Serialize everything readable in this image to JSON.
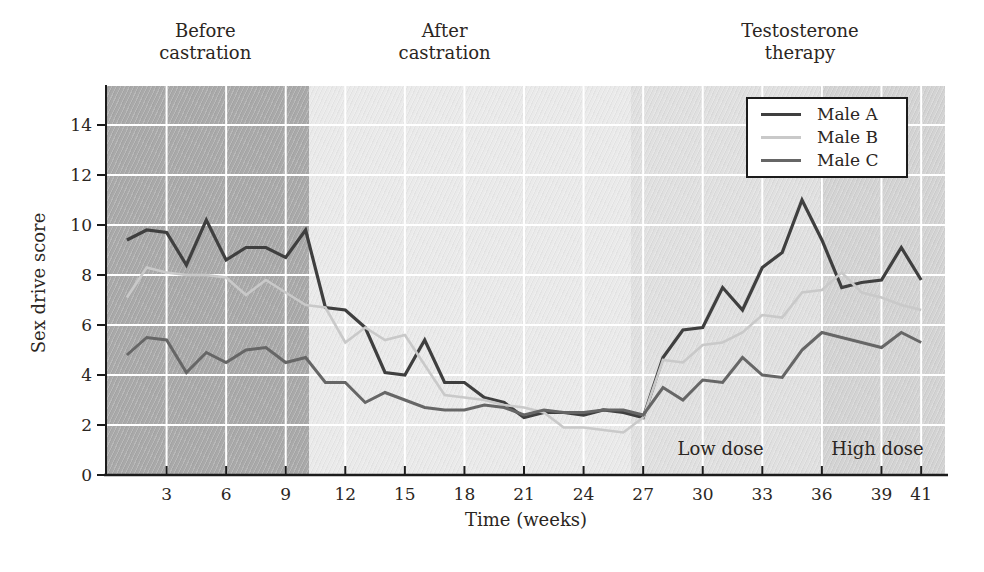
{
  "figure": {
    "x_axis_label": "Time (weeks)",
    "y_axis_label": "Sex drive score",
    "phase_labels": [
      {
        "text": "Before\ncastration",
        "center_week": 4.95
      },
      {
        "text": "After\ncastration",
        "center_week": 17.0
      },
      {
        "text": "Testosterone\ntherapy",
        "center_week": 34.9
      }
    ],
    "dose_labels": [
      {
        "text": "Low dose",
        "center_week": 30.9,
        "value": 1.1
      },
      {
        "text": "High dose",
        "center_week": 38.8,
        "value": 1.1
      }
    ]
  },
  "legend": {
    "items": [
      {
        "label": "Male A"
      },
      {
        "label": "Male B"
      },
      {
        "label": "Male C"
      }
    ]
  },
  "chart_data": {
    "type": "line",
    "title": "",
    "xlabel": "Time (weeks)",
    "ylabel": "Sex drive score",
    "xlim": [
      0,
      42.2
    ],
    "ylim": [
      0,
      15.56
    ],
    "x_ticks": [
      3,
      6,
      9,
      12,
      15,
      18,
      21,
      24,
      27,
      30,
      33,
      36,
      39,
      41
    ],
    "y_ticks": [
      0,
      2,
      4,
      6,
      8,
      10,
      12,
      14
    ],
    "grid": true,
    "grid_color": "#ffffff",
    "axis_color": "#1c1c1c",
    "legend_position": "top-right",
    "weeks": [
      1,
      2,
      3,
      4,
      5,
      6,
      7,
      8,
      9,
      10,
      11,
      12,
      13,
      14,
      15,
      16,
      17,
      18,
      19,
      20,
      21,
      22,
      23,
      24,
      25,
      26,
      27,
      28,
      29,
      30,
      31,
      32,
      33,
      34,
      35,
      36,
      37,
      38,
      39,
      40,
      41
    ],
    "series": [
      {
        "name": "Male A",
        "color": "#3f3f3f",
        "stroke_width": 3.2,
        "values": [
          9.4,
          9.8,
          9.7,
          8.4,
          10.2,
          8.6,
          9.1,
          9.1,
          8.7,
          9.8,
          6.7,
          6.6,
          5.9,
          4.1,
          4.0,
          5.4,
          3.7,
          3.7,
          3.1,
          2.9,
          2.3,
          2.5,
          2.5,
          2.4,
          2.6,
          2.5,
          2.3,
          4.7,
          5.8,
          5.9,
          7.5,
          6.6,
          8.3,
          8.9,
          11.0,
          9.4,
          7.5,
          7.7,
          7.8,
          9.1,
          7.8
        ]
      },
      {
        "name": "Male B",
        "color": "#c9c9c9",
        "stroke_width": 2.6,
        "values": [
          7.1,
          8.3,
          8.1,
          8.0,
          8.0,
          7.9,
          7.2,
          7.8,
          7.3,
          6.8,
          6.7,
          5.3,
          5.9,
          5.4,
          5.6,
          4.4,
          3.2,
          3.1,
          3.0,
          2.8,
          2.7,
          2.5,
          1.9,
          1.9,
          1.8,
          1.7,
          2.3,
          4.6,
          4.5,
          5.2,
          5.3,
          5.7,
          6.4,
          6.3,
          7.3,
          7.4,
          8.1,
          7.3,
          7.1,
          6.8,
          6.6
        ]
      },
      {
        "name": "Male C",
        "color": "#666666",
        "stroke_width": 3.0,
        "values": [
          4.8,
          5.5,
          5.4,
          4.1,
          4.9,
          4.5,
          5.0,
          5.1,
          4.5,
          4.7,
          3.7,
          3.7,
          2.9,
          3.3,
          3.0,
          2.7,
          2.6,
          2.6,
          2.8,
          2.7,
          2.4,
          2.6,
          2.5,
          2.5,
          2.6,
          2.6,
          2.4,
          3.5,
          3.0,
          3.8,
          3.7,
          4.7,
          4.0,
          3.9,
          5.0,
          5.7,
          5.5,
          5.3,
          5.1,
          5.7,
          5.3
        ]
      }
    ],
    "regions": [
      {
        "label": "Before castration",
        "from_week": 0,
        "to_week": 10.15,
        "color": "#a9a9a9"
      },
      {
        "label": "After castration",
        "from_week": 10.15,
        "to_week": 26.4,
        "color": "#eaeaea"
      },
      {
        "label": "Testosterone therapy - Low dose",
        "from_week": 26.4,
        "to_week": 35.9,
        "color": "#e0e0e0"
      },
      {
        "label": "Testosterone therapy - High dose",
        "from_week": 35.9,
        "to_week": 42.2,
        "color": "#d3d3d3"
      }
    ]
  }
}
